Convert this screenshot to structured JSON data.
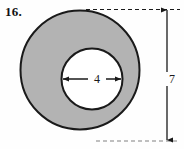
{
  "figure": {
    "item_number": "16.",
    "shape": "annulus",
    "fill_color": "#b3b3b3",
    "stroke_color": "#1a1a1a",
    "background_color": "#fefefe",
    "inner_diameter_label": "4",
    "outer_diameter_label": "7",
    "inner_circle": {
      "center_x": 92,
      "center_y": 79,
      "radius": 31
    },
    "outer_circle": {
      "center_x": 80,
      "center_y": 70,
      "radius": 60
    },
    "dimension_lines": {
      "inner": {
        "orientation": "horizontal",
        "style": "double-arrow",
        "label": "4"
      },
      "outer": {
        "orientation": "vertical",
        "style": "double-arrow",
        "label": "7",
        "leader_style": "dashed"
      }
    }
  }
}
